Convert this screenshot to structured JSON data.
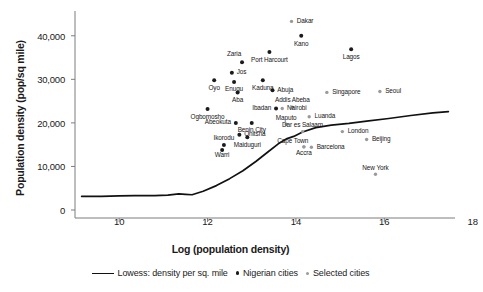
{
  "chart_data": {
    "type": "scatter",
    "title": "",
    "xlabel": "Log (population density)",
    "ylabel": "Population density (pop/sq mile)",
    "xlim": [
      9.0,
      17.6
    ],
    "ylim": [
      0,
      45000
    ],
    "xticks": [
      10,
      12,
      14,
      16,
      18
    ],
    "xticklabels": [
      "10",
      "12",
      "14",
      "16",
      "18"
    ],
    "yticks": [
      0,
      10000,
      20000,
      30000,
      40000
    ],
    "yticklabels": [
      "0",
      "10,000",
      "20,000",
      "30,000",
      "40,000"
    ],
    "grid": false,
    "legend_position": "below-axes",
    "series": [
      {
        "name": "Lowess: density per sq. mile",
        "type": "line",
        "color": "#111111",
        "points": [
          {
            "x": 9.15,
            "y": 3150
          },
          {
            "x": 9.6,
            "y": 3150
          },
          {
            "x": 10.0,
            "y": 3250
          },
          {
            "x": 10.35,
            "y": 3280
          },
          {
            "x": 10.8,
            "y": 3300
          },
          {
            "x": 11.1,
            "y": 3400
          },
          {
            "x": 11.35,
            "y": 3700
          },
          {
            "x": 11.5,
            "y": 3600
          },
          {
            "x": 11.65,
            "y": 3500
          },
          {
            "x": 11.9,
            "y": 4300
          },
          {
            "x": 12.2,
            "y": 5600
          },
          {
            "x": 12.5,
            "y": 7200
          },
          {
            "x": 12.8,
            "y": 9000
          },
          {
            "x": 13.1,
            "y": 11200
          },
          {
            "x": 13.35,
            "y": 13200
          },
          {
            "x": 13.6,
            "y": 15200
          },
          {
            "x": 13.8,
            "y": 16400
          },
          {
            "x": 13.95,
            "y": 16900
          },
          {
            "x": 14.15,
            "y": 17900
          },
          {
            "x": 14.45,
            "y": 18900
          },
          {
            "x": 14.8,
            "y": 19500
          },
          {
            "x": 15.2,
            "y": 19900
          },
          {
            "x": 15.6,
            "y": 20400
          },
          {
            "x": 16.1,
            "y": 21000
          },
          {
            "x": 16.6,
            "y": 21700
          },
          {
            "x": 17.1,
            "y": 22300
          },
          {
            "x": 17.45,
            "y": 22600
          }
        ]
      },
      {
        "name": "Nigerian cities",
        "type": "points",
        "color": "#1b1b1b",
        "marker_size": 2.0,
        "points": [
          {
            "label": "Zaria",
            "x": 12.78,
            "y": 33900,
            "lx": 12.6,
            "ly": 35700,
            "anchor": "middle"
          },
          {
            "label": "Port Harcourt",
            "x": 13.4,
            "y": 36300,
            "lx": 13.4,
            "ly": 34400,
            "anchor": "middle"
          },
          {
            "label": "Jos",
            "x": 12.55,
            "y": 31500,
            "lx": 12.66,
            "ly": 31500,
            "anchor": "start"
          },
          {
            "label": "Oyo",
            "x": 12.15,
            "y": 29800,
            "lx": 12.15,
            "ly": 28000,
            "anchor": "middle"
          },
          {
            "label": "Enugu",
            "x": 12.6,
            "y": 29400,
            "lx": 12.6,
            "ly": 27600,
            "anchor": "middle"
          },
          {
            "label": "Kaduna",
            "x": 13.25,
            "y": 29800,
            "lx": 13.25,
            "ly": 27800,
            "anchor": "middle"
          },
          {
            "label": "Abuja",
            "x": 13.47,
            "y": 27500,
            "lx": 13.58,
            "ly": 27500,
            "anchor": "start"
          },
          {
            "label": "Aba",
            "x": 12.68,
            "y": 27000,
            "lx": 12.68,
            "ly": 25100,
            "anchor": "middle"
          },
          {
            "label": "Ibadan",
            "x": 13.55,
            "y": 23300,
            "lx": 13.44,
            "ly": 23300,
            "anchor": "end"
          },
          {
            "label": "Ogbomosho",
            "x": 12.0,
            "y": 23200,
            "lx": 12.0,
            "ly": 21300,
            "anchor": "middle"
          },
          {
            "label": "Abeokuta",
            "x": 12.64,
            "y": 20000,
            "lx": 12.53,
            "ly": 20000,
            "anchor": "end"
          },
          {
            "label": "Benin City",
            "x": 13.0,
            "y": 20000,
            "lx": 13.0,
            "ly": 18200,
            "anchor": "middle"
          },
          {
            "label": "Onitsha",
            "x": 12.72,
            "y": 17300,
            "lx": 12.83,
            "ly": 17300,
            "anchor": "start"
          },
          {
            "label": "Maiduguri",
            "x": 12.9,
            "y": 16700,
            "lx": 12.9,
            "ly": 14900,
            "anchor": "middle"
          },
          {
            "label": "Ikorodu",
            "x": 12.37,
            "y": 14900,
            "lx": 12.37,
            "ly": 16400,
            "anchor": "middle"
          },
          {
            "label": "Warri",
            "x": 12.33,
            "y": 13800,
            "lx": 12.33,
            "ly": 12400,
            "anchor": "middle"
          },
          {
            "label": "Kano",
            "x": 14.12,
            "y": 40000,
            "lx": 14.12,
            "ly": 38100,
            "anchor": "middle"
          },
          {
            "label": "Lagos",
            "x": 15.25,
            "y": 36900,
            "lx": 15.25,
            "ly": 35000,
            "anchor": "middle"
          }
        ]
      },
      {
        "name": "Selected cities",
        "type": "points",
        "color": "#9a9a9a",
        "marker_size": 1.7,
        "points": [
          {
            "label": "Dakar",
            "x": 13.9,
            "y": 43300,
            "lx": 14.02,
            "ly": 43300,
            "anchor": "start"
          },
          {
            "label": "Singapore",
            "x": 14.7,
            "y": 27000,
            "lx": 14.82,
            "ly": 27000,
            "anchor": "start"
          },
          {
            "label": "Seoul",
            "x": 15.9,
            "y": 27200,
            "lx": 16.02,
            "ly": 27200,
            "anchor": "start"
          },
          {
            "label": "Addis Abeba",
            "x": 13.92,
            "y": 23600,
            "lx": 13.92,
            "ly": 25100,
            "anchor": "middle"
          },
          {
            "label": "Nairobi",
            "x": 13.69,
            "y": 23300,
            "lx": 13.8,
            "ly": 23300,
            "anchor": "start"
          },
          {
            "label": "Luanda",
            "x": 14.3,
            "y": 21400,
            "lx": 14.42,
            "ly": 21400,
            "anchor": "start"
          },
          {
            "label": "Maputo",
            "x": 13.78,
            "y": 19700,
            "lx": 13.78,
            "ly": 21000,
            "anchor": "middle"
          },
          {
            "label": "Dar es Salaam",
            "x": 14.15,
            "y": 18000,
            "lx": 14.15,
            "ly": 19300,
            "anchor": "middle"
          },
          {
            "label": "London",
            "x": 15.05,
            "y": 18000,
            "lx": 15.17,
            "ly": 18000,
            "anchor": "start"
          },
          {
            "label": "Beijing",
            "x": 15.6,
            "y": 16200,
            "lx": 15.72,
            "ly": 16200,
            "anchor": "start"
          },
          {
            "label": "Cape Town",
            "x": 14.18,
            "y": 14500,
            "lx": 13.93,
            "ly": 15700,
            "anchor": "middle"
          },
          {
            "label": "Barcelona",
            "x": 14.35,
            "y": 14400,
            "lx": 14.47,
            "ly": 14400,
            "anchor": "start"
          },
          {
            "label": "Accra",
            "x": 14.18,
            "y": 14500,
            "lx": 14.18,
            "ly": 12900,
            "anchor": "middle"
          },
          {
            "label": "New York",
            "x": 15.8,
            "y": 8200,
            "lx": 15.8,
            "ly": 9600,
            "anchor": "middle"
          }
        ]
      }
    ],
    "legend": [
      {
        "key": "lowess-line",
        "label": "Lowess: density per sq. mile",
        "marker": "line",
        "color": "#111111"
      },
      {
        "key": "nigerian-cities",
        "label": "Nigerian cities",
        "marker": "dot",
        "color": "#1b1b1b"
      },
      {
        "key": "selected-cities",
        "label": "Selected cities",
        "marker": "dot-light",
        "color": "#9a9a9a"
      }
    ]
  }
}
